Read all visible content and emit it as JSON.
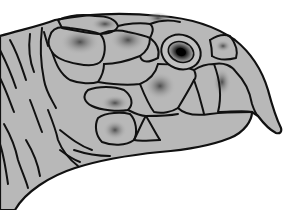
{
  "illustration": {
    "subject": "Turtle head in profile",
    "facing": "right",
    "colors": {
      "background": "#ffffff",
      "skin": "#b8b8b8",
      "skin_light": "#c6c6c6",
      "shading": "#4a4a4a",
      "outline": "#111111",
      "eye_pupil": "#0a0a0a"
    },
    "parts": [
      "neck-wrinkles",
      "head-scutes",
      "eye",
      "beak",
      "jaw"
    ]
  }
}
